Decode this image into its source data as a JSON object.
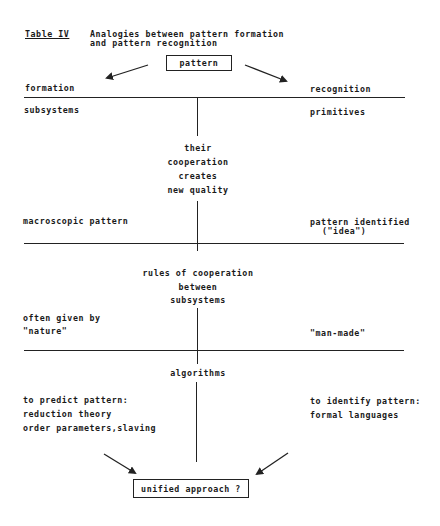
{
  "table": {
    "label": "Table IV",
    "caption_line1": "Analogies between pattern formation",
    "caption_line2": "and pattern recognition"
  },
  "top_box": "pattern",
  "columns": {
    "left": "formation",
    "right": "recognition"
  },
  "section1": {
    "left": "subsystems",
    "right": "primitives",
    "center": [
      "their",
      "cooperation",
      "creates",
      "new quality"
    ],
    "left_result": "macroscopic pattern",
    "right_result_line1": "pattern identified",
    "right_result_line2": "(\"idea\")"
  },
  "section2": {
    "center": [
      "rules of cooperation",
      "between",
      "subsystems"
    ],
    "left_line1": "often given by",
    "left_line2": "\"nature\"",
    "right": "\"man-made\""
  },
  "section3": {
    "center": "algorithms",
    "left": [
      "to predict pattern:",
      "reduction theory",
      "order parameters,slaving"
    ],
    "right": [
      "to identify pattern:",
      "formal languages"
    ]
  },
  "bottom_box": "unified approach ?"
}
